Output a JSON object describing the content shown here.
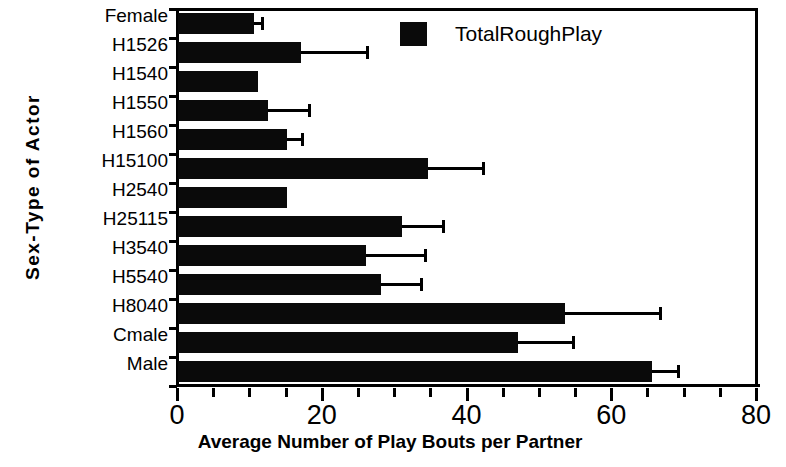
{
  "chart_data": {
    "type": "bar",
    "orientation": "horizontal",
    "title": "",
    "xlabel": "Average Number of Play Bouts per Partner",
    "ylabel": "Sex-Type of Actor",
    "xlim": [
      0,
      80
    ],
    "xticks": [
      0,
      20,
      40,
      60,
      80
    ],
    "xtick_labels": [
      "0",
      "20",
      "40",
      "60",
      "80"
    ],
    "minor_xticks": [
      5,
      10,
      15,
      25,
      30,
      35,
      45,
      50,
      55,
      65,
      70,
      75
    ],
    "grid": false,
    "legend_position": "top-right",
    "series": [
      {
        "name": "TotalRoughPlay",
        "color": "#0a0a0a",
        "values": [
          10.5,
          17.0,
          11.0,
          12.5,
          15.0,
          34.5,
          15.0,
          31.0,
          26.0,
          28.0,
          53.5,
          47.0,
          65.5
        ],
        "error_upper": [
          11.5,
          26.0,
          11.0,
          18.0,
          17.0,
          42.0,
          15.0,
          36.5,
          34.0,
          33.5,
          66.5,
          54.5,
          69.0
        ]
      }
    ],
    "categories": [
      "Female",
      "H1526",
      "H1540",
      "H1550",
      "H1560",
      "H15100",
      "H2540",
      "H25115",
      "H3540",
      "H5540",
      "H8040",
      "Cmale",
      "Male"
    ]
  },
  "legend": {
    "entries": [
      {
        "label": "TotalRoughPlay",
        "color": "#0a0a0a"
      }
    ]
  },
  "axes": {
    "y_title": "Sex-Type of Actor",
    "x_title": "Average Number of Play Bouts per Partner"
  }
}
